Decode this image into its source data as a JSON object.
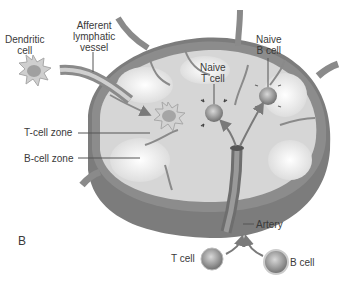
{
  "figure": {
    "panel_label": "B",
    "labels": {
      "dendritic_cell": [
        "Dendritic",
        "cell"
      ],
      "afferent_vessel": [
        "Afferent",
        "lymphatic",
        "vessel"
      ],
      "naive_t_cell": [
        "Naive",
        "T cell"
      ],
      "naive_b_cell": [
        "Naive",
        "B cell"
      ],
      "t_cell_zone": "T-cell zone",
      "b_cell_zone": "B-cell zone",
      "artery": "Artery",
      "t_cell": "T cell",
      "b_cell": "B cell"
    },
    "colors": {
      "capsule": "#8a8a8a",
      "capsule_dark": "#6e6e6e",
      "interior": "#d9d9d9",
      "interior_light": "#f2f2f2",
      "cell": "#9a9a9a",
      "vessel": "#7a7a7a"
    }
  }
}
